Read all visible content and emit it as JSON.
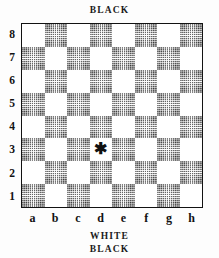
{
  "diagram": {
    "type": "chessboard",
    "caption_top": "BLACK",
    "caption_bottom_primary": "WHITE",
    "caption_bottom_secondary": "BLACK",
    "orientation": "white-at-bottom",
    "files": [
      "a",
      "b",
      "c",
      "d",
      "e",
      "f",
      "g",
      "h"
    ],
    "ranks": [
      "8",
      "7",
      "6",
      "5",
      "4",
      "3",
      "2",
      "1"
    ],
    "marker_glyph": "✱",
    "marker_square": "d3",
    "colors": {
      "page_background": "#fdfdfd",
      "light_square": "#ffffff",
      "dark_square": "#8c8c8c",
      "border": "#121212",
      "text": "#121212"
    },
    "squares": [
      {
        "id": "a8",
        "shade": "light"
      },
      {
        "id": "b8",
        "shade": "dark"
      },
      {
        "id": "c8",
        "shade": "light"
      },
      {
        "id": "d8",
        "shade": "dark"
      },
      {
        "id": "e8",
        "shade": "light"
      },
      {
        "id": "f8",
        "shade": "dark"
      },
      {
        "id": "g8",
        "shade": "light"
      },
      {
        "id": "h8",
        "shade": "dark"
      },
      {
        "id": "a7",
        "shade": "dark"
      },
      {
        "id": "b7",
        "shade": "light"
      },
      {
        "id": "c7",
        "shade": "dark"
      },
      {
        "id": "d7",
        "shade": "light"
      },
      {
        "id": "e7",
        "shade": "dark"
      },
      {
        "id": "f7",
        "shade": "light"
      },
      {
        "id": "g7",
        "shade": "dark"
      },
      {
        "id": "h7",
        "shade": "light"
      },
      {
        "id": "a6",
        "shade": "light"
      },
      {
        "id": "b6",
        "shade": "dark"
      },
      {
        "id": "c6",
        "shade": "light"
      },
      {
        "id": "d6",
        "shade": "dark"
      },
      {
        "id": "e6",
        "shade": "light"
      },
      {
        "id": "f6",
        "shade": "dark"
      },
      {
        "id": "g6",
        "shade": "light"
      },
      {
        "id": "h6",
        "shade": "dark"
      },
      {
        "id": "a5",
        "shade": "dark"
      },
      {
        "id": "b5",
        "shade": "light"
      },
      {
        "id": "c5",
        "shade": "dark"
      },
      {
        "id": "d5",
        "shade": "light"
      },
      {
        "id": "e5",
        "shade": "dark"
      },
      {
        "id": "f5",
        "shade": "light"
      },
      {
        "id": "g5",
        "shade": "dark"
      },
      {
        "id": "h5",
        "shade": "light"
      },
      {
        "id": "a4",
        "shade": "light"
      },
      {
        "id": "b4",
        "shade": "dark"
      },
      {
        "id": "c4",
        "shade": "light"
      },
      {
        "id": "d4",
        "shade": "dark"
      },
      {
        "id": "e4",
        "shade": "light"
      },
      {
        "id": "f4",
        "shade": "dark"
      },
      {
        "id": "g4",
        "shade": "light"
      },
      {
        "id": "h4",
        "shade": "dark"
      },
      {
        "id": "a3",
        "shade": "dark"
      },
      {
        "id": "b3",
        "shade": "light"
      },
      {
        "id": "c3",
        "shade": "dark"
      },
      {
        "id": "d3",
        "shade": "light",
        "marker": "✱"
      },
      {
        "id": "e3",
        "shade": "dark"
      },
      {
        "id": "f3",
        "shade": "light"
      },
      {
        "id": "g3",
        "shade": "dark"
      },
      {
        "id": "h3",
        "shade": "light"
      },
      {
        "id": "a2",
        "shade": "light"
      },
      {
        "id": "b2",
        "shade": "dark"
      },
      {
        "id": "c2",
        "shade": "light"
      },
      {
        "id": "d2",
        "shade": "dark"
      },
      {
        "id": "e2",
        "shade": "light"
      },
      {
        "id": "f2",
        "shade": "dark"
      },
      {
        "id": "g2",
        "shade": "light"
      },
      {
        "id": "h2",
        "shade": "dark"
      },
      {
        "id": "a1",
        "shade": "dark"
      },
      {
        "id": "b1",
        "shade": "light"
      },
      {
        "id": "c1",
        "shade": "dark"
      },
      {
        "id": "d1",
        "shade": "light"
      },
      {
        "id": "e1",
        "shade": "dark"
      },
      {
        "id": "f1",
        "shade": "light"
      },
      {
        "id": "g1",
        "shade": "dark"
      },
      {
        "id": "h1",
        "shade": "light"
      }
    ]
  }
}
